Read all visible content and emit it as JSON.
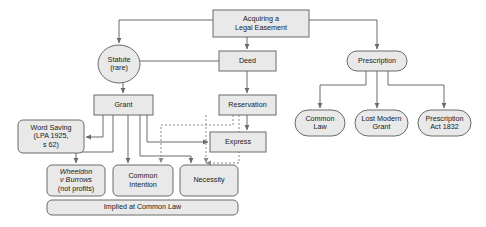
{
  "diagram": {
    "type": "flowchart",
    "background_color": "#ffffff",
    "node_fill": "#e9e9e9",
    "node_stroke": "#6b6b6b",
    "text_color": "#1a1a1a",
    "dashed_stroke": "#8a8a8a",
    "nodes": [
      {
        "id": "root",
        "name": "acquiring-a-legal-easement",
        "shape": "rect",
        "x": 213,
        "y": 10,
        "w": 96,
        "h": 27,
        "lines": [
          "Acquiring a",
          "Legal Easement"
        ]
      },
      {
        "id": "statute",
        "name": "statute-rare",
        "shape": "ellipse",
        "x": 98,
        "y": 45,
        "w": 42,
        "h": 38,
        "lines": [
          "Statute",
          "(rare)"
        ]
      },
      {
        "id": "deed",
        "name": "deed",
        "shape": "rect",
        "x": 219,
        "y": 51,
        "w": 57,
        "h": 20,
        "lines": [
          "Deed"
        ]
      },
      {
        "id": "prescription",
        "name": "prescription",
        "shape": "stadium",
        "x": 347,
        "y": 51,
        "w": 60,
        "h": 20,
        "lines": [
          "Prescription"
        ]
      },
      {
        "id": "grant",
        "name": "grant",
        "shape": "rect",
        "x": 94,
        "y": 95,
        "w": 59,
        "h": 20,
        "lines": [
          "Grant"
        ]
      },
      {
        "id": "reservation",
        "name": "reservation",
        "shape": "rect",
        "x": 219,
        "y": 95,
        "w": 57,
        "h": 20,
        "lines": [
          "Reservation"
        ]
      },
      {
        "id": "common-law",
        "name": "common-law",
        "shape": "stadium",
        "x": 295,
        "y": 110,
        "w": 50,
        "h": 26,
        "lines": [
          "Common",
          "Law"
        ]
      },
      {
        "id": "lost-modern-grant",
        "name": "lost-modern-grant",
        "shape": "stadium",
        "x": 355,
        "y": 110,
        "w": 53,
        "h": 26,
        "lines": [
          "Lost Modern",
          "Grant"
        ]
      },
      {
        "id": "prescription-act",
        "name": "prescription-act-1832",
        "shape": "stadium",
        "x": 418,
        "y": 110,
        "w": 53,
        "h": 26,
        "lines": [
          "Prescription",
          "Act 1832"
        ]
      },
      {
        "id": "word-saving",
        "name": "word-saving-lpa-1925-s62",
        "shape": "roundrect",
        "x": 18,
        "y": 120,
        "w": 66,
        "h": 33,
        "lines": [
          "Word Saving",
          "(LPA 1925,",
          "s 62)"
        ]
      },
      {
        "id": "express",
        "name": "express",
        "shape": "rect",
        "x": 210,
        "y": 132,
        "w": 56,
        "h": 20,
        "lines": [
          "Express"
        ]
      },
      {
        "id": "wheeldon",
        "name": "wheeldon-v-burrows",
        "shape": "roundrect",
        "x": 47,
        "y": 165,
        "w": 58,
        "h": 31,
        "lines": [
          "Wheeldon",
          "v Burrows",
          "(not profits)"
        ],
        "italic_lines": [
          0,
          1
        ]
      },
      {
        "id": "common-intention",
        "name": "common-intention",
        "shape": "roundrect",
        "x": 113,
        "y": 165,
        "w": 60,
        "h": 31,
        "lines": [
          "Common",
          "Intention"
        ]
      },
      {
        "id": "necessity",
        "name": "necessity",
        "shape": "roundrect",
        "x": 180,
        "y": 165,
        "w": 58,
        "h": 31,
        "lines": [
          "Necessity"
        ]
      },
      {
        "id": "implied",
        "name": "implied-at-common-law",
        "shape": "roundrect",
        "x": 47,
        "y": 200,
        "w": 191,
        "h": 15,
        "lines": [
          "Implied at Common Law"
        ]
      }
    ],
    "edges": [
      {
        "name": "edge-root-to-statute",
        "style": "solid",
        "arrow": true,
        "path": "M 213 20 L 119 20 L 119 43"
      },
      {
        "name": "edge-root-to-deed",
        "style": "solid",
        "arrow": true,
        "path": "M 247 37 L 247 49"
      },
      {
        "name": "edge-root-to-prescription",
        "style": "solid",
        "arrow": true,
        "path": "M 309 20 L 377 20 L 377 49"
      },
      {
        "name": "edge-deed-to-grant",
        "style": "solid",
        "arrow": true,
        "path": "M 219 61 L 123 61 L 123 93"
      },
      {
        "name": "edge-deed-to-reservation",
        "style": "solid",
        "arrow": true,
        "path": "M 247 71 L 247 93"
      },
      {
        "name": "edge-prescription-to-common-law",
        "style": "solid",
        "arrow": true,
        "path": "M 366 71 L 366 85 L 320 85 L 320 108"
      },
      {
        "name": "edge-prescription-to-lost-modern-grant",
        "style": "solid",
        "arrow": true,
        "path": "M 377 71 L 377 108"
      },
      {
        "name": "edge-prescription-to-prescription-act",
        "style": "solid",
        "arrow": true,
        "path": "M 388 71 L 388 85 L 444 85 L 444 108"
      },
      {
        "name": "edge-grant-to-word-saving",
        "style": "solid",
        "arrow": true,
        "path": "M 103 115 L 103 137 L 86 137"
      },
      {
        "name": "edge-grant-to-wheeldon",
        "style": "solid",
        "arrow": true,
        "path": "M 113 115 L 113 152 L 76 152 L 76 163"
      },
      {
        "name": "edge-grant-to-common-intention",
        "style": "solid",
        "arrow": true,
        "path": "M 128 115 L 128 163"
      },
      {
        "name": "edge-grant-to-necessity",
        "style": "solid",
        "arrow": true,
        "path": "M 140 115 L 140 156 L 191 156 L 191 163"
      },
      {
        "name": "edge-grant-to-express",
        "style": "solid",
        "arrow": true,
        "path": "M 147 115 L 147 142 L 208 142"
      },
      {
        "name": "edge-reservation-to-express",
        "style": "solid",
        "arrow": true,
        "path": "M 247 115 L 247 130"
      },
      {
        "name": "edge-reservation-to-common-intention-dashed",
        "style": "dashed",
        "arrow": true,
        "path": "M 233 115 L 233 125 L 161 125 L 161 163"
      },
      {
        "name": "edge-reservation-to-necessity-dashed",
        "style": "dashed",
        "arrow": true,
        "path": "M 239 115 L 239 163 L 206 163"
      },
      {
        "name": "edge-express-to-necessity-dashed",
        "style": "dashed",
        "arrow": true,
        "path": "M 206 115 L 206 163"
      }
    ]
  }
}
